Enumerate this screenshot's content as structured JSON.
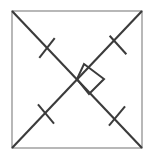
{
  "figure": {
    "canvas": {
      "width": 152,
      "height": 158,
      "background": "#ffffff"
    },
    "colors": {
      "square_stroke": "#9a9a9a",
      "diagonal_stroke": "#3b3b3b",
      "tick_stroke": "#3b3b3b",
      "right_angle_stroke": "#3b3b3b",
      "fill": "#ffffff"
    },
    "square": {
      "label": "square-outline",
      "x": 12,
      "y": 11,
      "width": 130,
      "height": 137,
      "stroke_width": 1.4
    },
    "diagonals": [
      {
        "label": "diagonal-tl-br",
        "x1": 12,
        "y1": 11,
        "x2": 142,
        "y2": 148,
        "stroke_width": 2.1
      },
      {
        "label": "diagonal-tr-bl",
        "x1": 142,
        "y1": 11,
        "x2": 12,
        "y2": 148,
        "stroke_width": 2.1
      }
    ],
    "tick_marks": [
      {
        "label": "tick-upper-left",
        "cx": 47,
        "cy": 48,
        "length": 25,
        "angle": -52,
        "stroke_width": 2.0
      },
      {
        "label": "tick-upper-right",
        "cx": 118,
        "cy": 45,
        "length": 25,
        "angle": 48,
        "stroke_width": 2.0
      },
      {
        "label": "tick-lower-left",
        "cx": 46,
        "cy": 114,
        "length": 25,
        "angle": 50,
        "stroke_width": 2.0
      },
      {
        "label": "tick-lower-right",
        "cx": 117,
        "cy": 116,
        "length": 25,
        "angle": -50,
        "stroke_width": 2.0
      }
    ],
    "right_angle_marker": {
      "label": "right-angle-square",
      "points": "84,64 104,79 89,94 77,79",
      "stroke_width": 2.0,
      "description": "right angle at diagonal intersection"
    },
    "intersection": {
      "label": "diagonal-intersection",
      "x": 77,
      "y": 79
    }
  }
}
